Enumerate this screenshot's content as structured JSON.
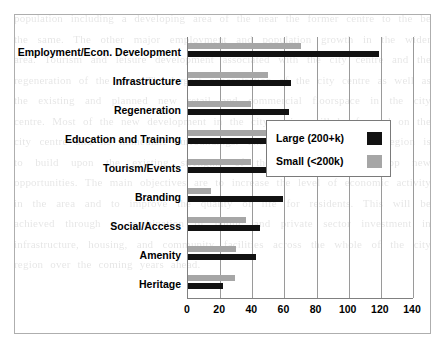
{
  "figure": {
    "border_color": "#aeaeae"
  },
  "legend": {
    "position": "inside-right",
    "items": [
      {
        "label": "Large (200+k)",
        "color": "#121212"
      },
      {
        "label": "Small (<200k)",
        "color": "#a6a6a6"
      }
    ]
  },
  "background_text": "population including a developing area of the near the former centre to the be the same. The other major employment and population growth in the wider area. Tourism and leisure development associated with the city centre and the regeneration of the area. The largest concentration of the city centre as well as the existing and planned new retail and commercial floorspace in the city centre. Most of the new development in the city region will be focused on the city centre and its immediate surroundings. The strategy for the city region is to build upon the existing strengths of the area and to develop new opportunities. The main objectives are to increase the level of economic activity in the area and to improve the quality of life for residents. This will be achieved through a combination of public and private sector investment in infrastructure, housing, and community facilities across the whole of the city region over the coming years ahead.",
  "chart_data": {
    "type": "bar",
    "orientation": "horizontal",
    "title": "",
    "xlabel": "",
    "ylabel": "",
    "xlim": [
      0,
      140
    ],
    "xticks": [
      0,
      20,
      40,
      60,
      80,
      100,
      120,
      140
    ],
    "xtick_labels": [
      "0",
      "20",
      "40",
      "60",
      "80",
      "100",
      "120",
      "140"
    ],
    "grid": "vertical",
    "legend_position": "inside-right",
    "categories": [
      "Employment/Econ. Development",
      "Infrastructure",
      "Regeneration",
      "Education and Training",
      "Tourism/Events",
      "Branding",
      "Social/Access",
      "Amenity",
      "Heritage"
    ],
    "series": [
      {
        "name": "Large (200+k)",
        "color": "#121212",
        "values": [
          119,
          64,
          63,
          54,
          53,
          59,
          45,
          42,
          22
        ]
      },
      {
        "name": "Small (<200k)",
        "color": "#a6a6a6",
        "values": [
          70,
          50,
          39,
          51,
          39,
          14,
          36,
          30,
          29
        ]
      }
    ]
  }
}
